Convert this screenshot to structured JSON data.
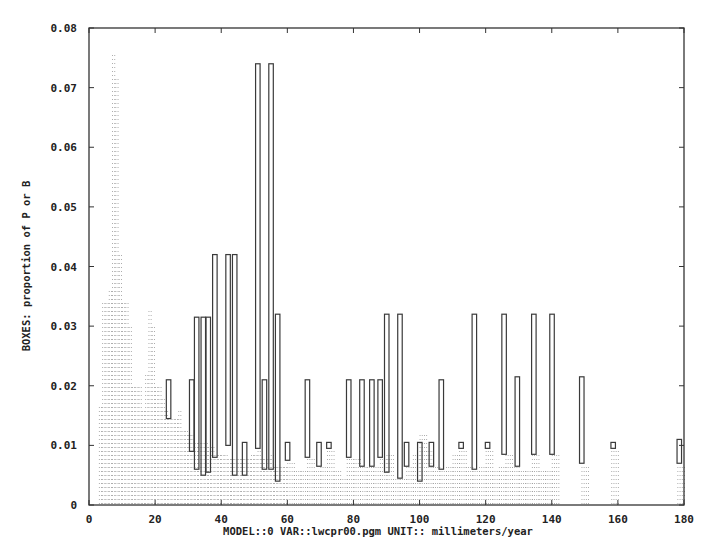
{
  "chart_data": {
    "type": "bar",
    "title": "",
    "xlabel": "MODEL::0 VAR::lwcpr00.pgm UNIT:: millimeters/year",
    "ylabel": "BOXES: proportion of P or B",
    "xlim": [
      0,
      180
    ],
    "ylim": [
      0,
      0.08
    ],
    "x_ticks": [
      "0",
      "20",
      "40",
      "60",
      "80",
      "100",
      "120",
      "140",
      "160",
      "180"
    ],
    "y_ticks": [
      "0",
      "0.01",
      "0.02",
      "0.03",
      "0.04",
      "0.05",
      "0.06",
      "0.07",
      "0.08"
    ],
    "grid": false,
    "legend": null,
    "series": [
      {
        "name": "B (solid boxes)",
        "style": "outlined boxes",
        "boxes": [
          {
            "x": 24,
            "bottom": 0.0145,
            "top": 0.021
          },
          {
            "x": 31,
            "bottom": 0.009,
            "top": 0.021
          },
          {
            "x": 32.5,
            "bottom": 0.006,
            "top": 0.0315
          },
          {
            "x": 34.5,
            "bottom": 0.005,
            "top": 0.0315
          },
          {
            "x": 36,
            "bottom": 0.0055,
            "top": 0.0315
          },
          {
            "x": 38,
            "bottom": 0.008,
            "top": 0.042
          },
          {
            "x": 42,
            "bottom": 0.01,
            "top": 0.042
          },
          {
            "x": 44,
            "bottom": 0.005,
            "top": 0.042
          },
          {
            "x": 47,
            "bottom": 0.005,
            "top": 0.0105
          },
          {
            "x": 51,
            "bottom": 0.0095,
            "top": 0.074
          },
          {
            "x": 53,
            "bottom": 0.006,
            "top": 0.021
          },
          {
            "x": 55,
            "bottom": 0.006,
            "top": 0.074
          },
          {
            "x": 57,
            "bottom": 0.004,
            "top": 0.032
          },
          {
            "x": 60,
            "bottom": 0.0075,
            "top": 0.0105
          },
          {
            "x": 66,
            "bottom": 0.008,
            "top": 0.021
          },
          {
            "x": 69.5,
            "bottom": 0.0065,
            "top": 0.0105
          },
          {
            "x": 72.5,
            "bottom": 0.0095,
            "top": 0.0105
          },
          {
            "x": 78.5,
            "bottom": 0.008,
            "top": 0.021
          },
          {
            "x": 82.5,
            "bottom": 0.0065,
            "top": 0.021
          },
          {
            "x": 85.5,
            "bottom": 0.0065,
            "top": 0.021
          },
          {
            "x": 88,
            "bottom": 0.008,
            "top": 0.021
          },
          {
            "x": 90,
            "bottom": 0.0055,
            "top": 0.032
          },
          {
            "x": 94,
            "bottom": 0.0045,
            "top": 0.032
          },
          {
            "x": 96,
            "bottom": 0.0065,
            "top": 0.0105
          },
          {
            "x": 100,
            "bottom": 0.004,
            "top": 0.0105
          },
          {
            "x": 103.5,
            "bottom": 0.0065,
            "top": 0.0105
          },
          {
            "x": 106.5,
            "bottom": 0.006,
            "top": 0.021
          },
          {
            "x": 112.5,
            "bottom": 0.0095,
            "top": 0.0105
          },
          {
            "x": 116.5,
            "bottom": 0.006,
            "top": 0.032
          },
          {
            "x": 120.5,
            "bottom": 0.0095,
            "top": 0.0105
          },
          {
            "x": 125.5,
            "bottom": 0.0085,
            "top": 0.032
          },
          {
            "x": 129.5,
            "bottom": 0.0065,
            "top": 0.0215
          },
          {
            "x": 134.5,
            "bottom": 0.0085,
            "top": 0.032
          },
          {
            "x": 140,
            "bottom": 0.0085,
            "top": 0.032
          },
          {
            "x": 149,
            "bottom": 0.007,
            "top": 0.0215
          },
          {
            "x": 158.5,
            "bottom": 0.0095,
            "top": 0.0105
          },
          {
            "x": 178.5,
            "bottom": 0.007,
            "top": 0.011
          }
        ]
      },
      {
        "name": "P (dotted boxes)",
        "style": "dotted fill",
        "x": [
          3,
          4,
          5,
          6,
          7,
          8,
          9,
          10,
          11,
          12,
          13,
          14,
          15,
          16,
          17,
          18,
          19,
          20,
          21,
          22,
          23,
          24,
          25,
          26,
          27,
          28,
          29,
          30,
          31,
          32,
          33,
          34,
          35,
          36,
          37,
          38,
          39,
          40,
          41,
          42,
          43,
          44,
          45,
          46,
          47,
          48,
          49,
          50,
          51,
          52,
          53,
          54,
          55,
          56,
          57,
          58,
          59,
          60,
          62,
          64,
          66,
          68,
          70,
          72,
          74,
          76,
          78,
          80,
          82,
          84,
          86,
          88,
          90,
          92,
          94,
          96,
          98,
          100,
          102,
          104,
          106,
          108,
          110,
          112,
          114,
          116,
          118,
          120,
          122,
          124,
          126,
          128,
          130,
          132,
          134,
          136,
          138,
          140,
          149,
          158,
          178
        ],
        "values": [
          0.017,
          0.034,
          0.034,
          0.036,
          0.076,
          0.072,
          0.042,
          0.034,
          0.034,
          0.03,
          0.02,
          0.02,
          0.02,
          0.016,
          0.022,
          0.033,
          0.03,
          0.02,
          0.02,
          0.018,
          0.016,
          0.015,
          0.015,
          0.015,
          0.016,
          0.013,
          0.013,
          0.012,
          0.012,
          0.011,
          0.011,
          0.011,
          0.011,
          0.01,
          0.01,
          0.009,
          0.009,
          0.009,
          0.009,
          0.008,
          0.008,
          0.008,
          0.008,
          0.008,
          0.008,
          0.008,
          0.009,
          0.009,
          0.0095,
          0.008,
          0.008,
          0.008,
          0.009,
          0.007,
          0.007,
          0.007,
          0.007,
          0.0075,
          0.006,
          0.006,
          0.008,
          0.006,
          0.0065,
          0.0095,
          0.006,
          0.005,
          0.008,
          0.008,
          0.0065,
          0.0065,
          0.007,
          0.008,
          0.009,
          0.005,
          0.005,
          0.0065,
          0.0085,
          0.012,
          0.0095,
          0.0065,
          0.006,
          0.007,
          0.009,
          0.0095,
          0.007,
          0.006,
          0.007,
          0.0095,
          0.006,
          0.007,
          0.0085,
          0.0065,
          0.006,
          0.006,
          0.0085,
          0.006,
          0.006,
          0.0085,
          0.007,
          0.0095,
          0.007
        ]
      }
    ]
  },
  "colors": {
    "background": "#ffffff",
    "axis": "#333333",
    "box_stroke": "#3a3a3a",
    "dots": "#9a9a9a"
  }
}
